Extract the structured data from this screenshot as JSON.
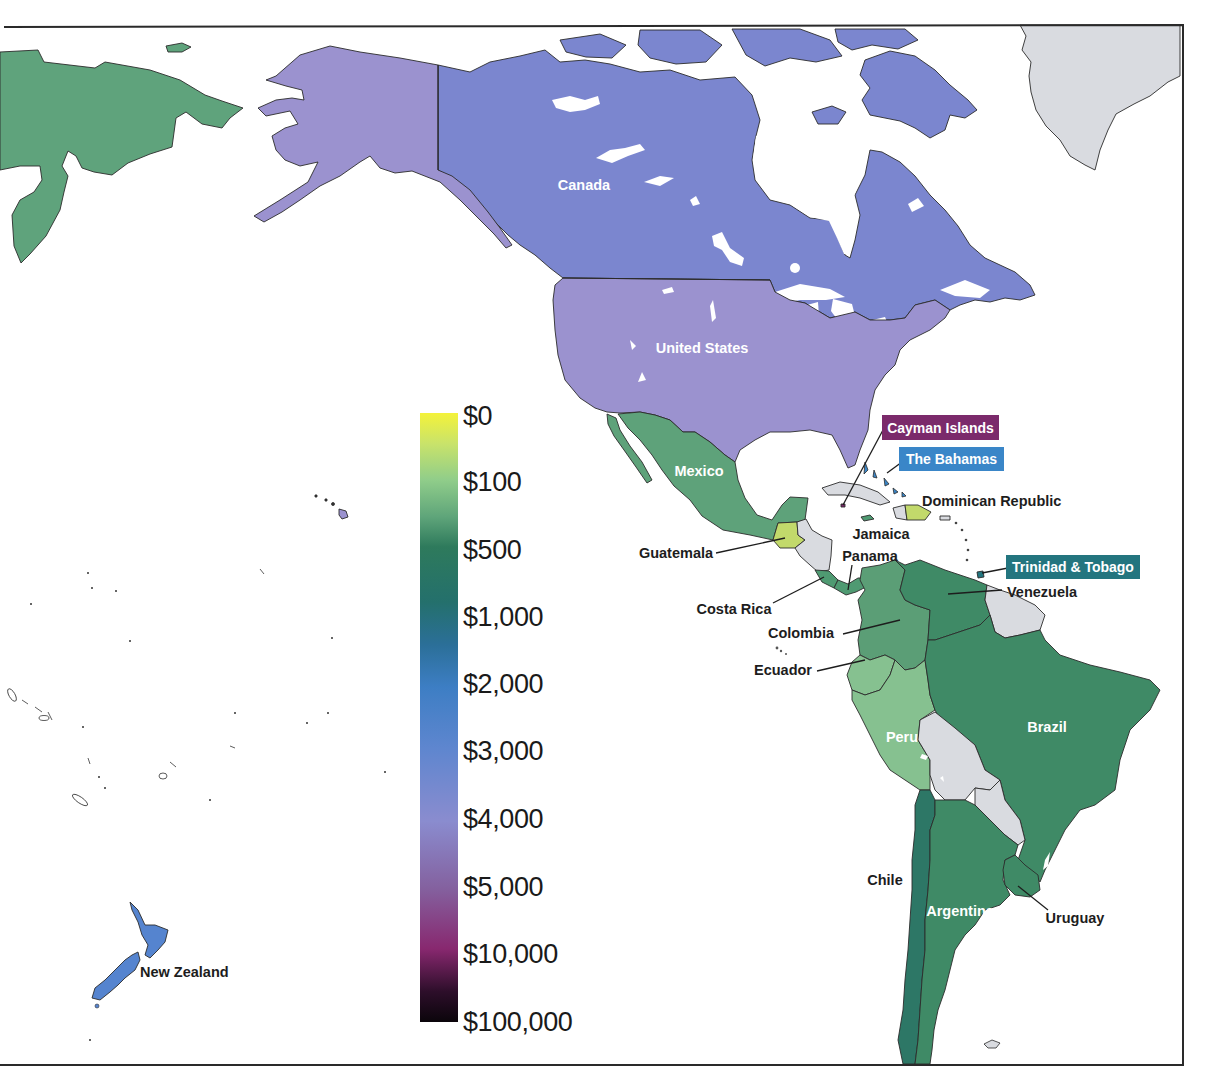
{
  "map": {
    "regions": {
      "russia": {
        "name": "Russia",
        "color": "#5fa37c",
        "approx_range": "$100–$500"
      },
      "canada": {
        "name": "Canada",
        "color": "#7b86cf",
        "approx_range": "$3,000–$4,000"
      },
      "united_states": {
        "name": "United States",
        "color": "#9b92cf",
        "approx_range": "$4,000–$5,000"
      },
      "mexico": {
        "name": "Mexico",
        "color": "#5ea27a",
        "approx_range": "$100–$500"
      },
      "guatemala": {
        "name": "Guatemala",
        "color": "#c2d96b",
        "approx_range": "$0–$100"
      },
      "dominican_republic": {
        "name": "Dominican Republic",
        "color": "#c2d96b",
        "approx_range": "$0–$100"
      },
      "costa_rica": {
        "name": "Costa Rica",
        "color": "#4f9a72",
        "approx_range": "$100–$500"
      },
      "panama": {
        "name": "Panama",
        "color": "#4f9a72",
        "approx_range": "$100–$500"
      },
      "jamaica": {
        "name": "Jamaica",
        "color": "#4f9a72",
        "approx_range": "$100–$500"
      },
      "colombia": {
        "name": "Colombia",
        "color": "#5b9e76",
        "approx_range": "$100–$500"
      },
      "venezuela": {
        "name": "Venezuela",
        "color": "#3f8a66",
        "approx_range": "≈$500"
      },
      "ecuador": {
        "name": "Ecuador",
        "color": "#86c190",
        "approx_range": "≈$100"
      },
      "peru": {
        "name": "Peru",
        "color": "#86c190",
        "approx_range": "≈$100"
      },
      "brazil": {
        "name": "Brazil",
        "color": "#3f8a66",
        "approx_range": "≈$500"
      },
      "chile": {
        "name": "Chile",
        "color": "#2d7766",
        "approx_range": "$500–$1,000"
      },
      "argentina": {
        "name": "Argentina",
        "color": "#3f8a66",
        "approx_range": "≈$500"
      },
      "uruguay": {
        "name": "Uruguay",
        "color": "#3f8a66",
        "approx_range": "≈$500"
      },
      "new_zealand": {
        "name": "New Zealand",
        "color": "#5584cf",
        "approx_range": "$2,000–$3,000"
      },
      "cayman_islands": {
        "name": "Cayman Islands",
        "color": "#7b2a6b",
        "approx_range": "$5,000–$10,000"
      },
      "the_bahamas": {
        "name": "The Bahamas",
        "color": "#3a86c8",
        "approx_range": "≈$2,000"
      },
      "trinidad_and_tobago": {
        "name": "Trinidad & Tobago",
        "color": "#23757f",
        "approx_range": "≈$1,000"
      },
      "no_data": {
        "name": "No data",
        "color": "#d9dbe0"
      }
    },
    "labels": {
      "canada": "Canada",
      "united_states": "United States",
      "mexico": "Mexico",
      "guatemala": "Guatemala",
      "costa_rica": "Costa Rica",
      "panama": "Panama",
      "jamaica": "Jamaica",
      "dominican_republic": "Dominican Republic",
      "cayman_islands": "Cayman Islands",
      "the_bahamas": "The Bahamas",
      "trinidad_and_tobago": "Trinidad & Tobago",
      "venezuela": "Venezuela",
      "colombia": "Colombia",
      "ecuador": "Ecuador",
      "peru": "Peru",
      "brazil": "Brazil",
      "chile": "Chile",
      "argentina": "Argentina",
      "uruguay": "Uruguay",
      "new_zealand": "New Zealand"
    }
  },
  "legend": {
    "ticks": [
      "$0",
      "$100",
      "$500",
      "$1,000",
      "$2,000",
      "$3,000",
      "$4,000",
      "$5,000",
      "$10,000",
      "$100,000"
    ],
    "stops": [
      {
        "offset": "0%",
        "color": "#f4f23a"
      },
      {
        "offset": "5%",
        "color": "#c9e36a"
      },
      {
        "offset": "11%",
        "color": "#90cd8a"
      },
      {
        "offset": "17%",
        "color": "#5fa57a"
      },
      {
        "offset": "22%",
        "color": "#2e7a5c"
      },
      {
        "offset": "31%",
        "color": "#24706c"
      },
      {
        "offset": "38%",
        "color": "#2b6f98"
      },
      {
        "offset": "45%",
        "color": "#3d7ec4"
      },
      {
        "offset": "55%",
        "color": "#5e86cf"
      },
      {
        "offset": "67%",
        "color": "#8a8ccf"
      },
      {
        "offset": "78%",
        "color": "#84619f"
      },
      {
        "offset": "88%",
        "color": "#88286f"
      },
      {
        "offset": "95%",
        "color": "#2d0e2a"
      },
      {
        "offset": "100%",
        "color": "#0b050b"
      }
    ]
  }
}
